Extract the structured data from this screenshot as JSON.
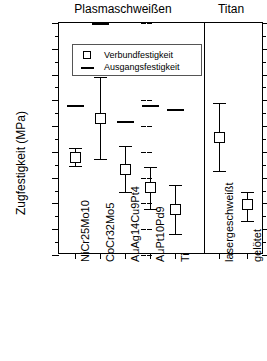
{
  "chart_data": {
    "type": "scatter",
    "title": "",
    "xlabel": "",
    "ylabel": "Zugfestigkeit (MPa)",
    "ylim": [
      0,
      900
    ],
    "ytick_step": 100,
    "yticks": [
      0,
      100,
      200,
      300,
      400,
      500,
      600,
      700,
      800,
      900
    ],
    "grid": false,
    "legend_position": "top-left-inside",
    "panels": [
      {
        "name": "Plasmaschweißen",
        "categories": [
          "NiCr25Mo10",
          "CoCr32Mo5",
          "AuAg14Cu9Pt4",
          "AuPt10Pd9",
          "Ti"
        ]
      },
      {
        "name": "Titan",
        "categories": [
          "lasergeschweißt",
          "gelötet"
        ]
      }
    ],
    "series": [
      {
        "name": "Verbundfestigkeit",
        "marker": "open-square",
        "values": [
          380,
          530,
          333,
          260,
          175,
          455,
          197
        ],
        "err_low": [
          345,
          372,
          245,
          180,
          80,
          325,
          133
        ],
        "err_high": [
          415,
          690,
          423,
          340,
          272,
          590,
          245
        ]
      },
      {
        "name": "Ausgangsfestigkeit",
        "marker": "dash",
        "values": [
          580,
          900,
          520,
          580,
          568,
          null,
          null
        ]
      }
    ],
    "categories_all": [
      "NiCr25Mo10",
      "CoCr32Mo5",
      "AuAg14Cu9Pt4",
      "AuPt10Pd9",
      "Ti",
      "lasergeschweißt",
      "gelötet"
    ],
    "legend": [
      {
        "label": "Verbundfestigkeit",
        "marker": "open-square"
      },
      {
        "label": "Ausgangsfestigkeit",
        "marker": "dash"
      }
    ]
  }
}
